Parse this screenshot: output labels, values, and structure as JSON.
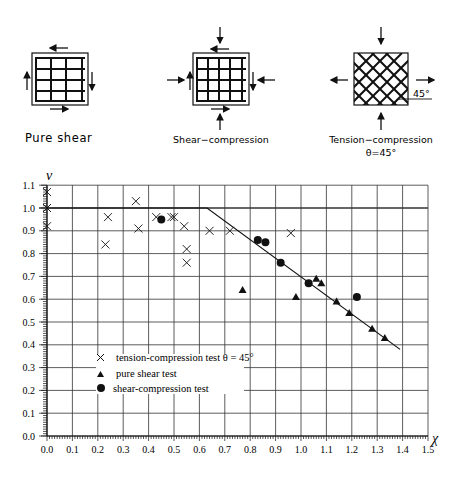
{
  "diagrams": [
    {
      "id": "pure-shear",
      "label": "Pure shear",
      "reinforcement": "orthogonal"
    },
    {
      "id": "shear-compression",
      "label": "Shear−compression",
      "reinforcement": "orthogonal"
    },
    {
      "id": "tension-compression",
      "label": "Tension−compression",
      "sublabel": "θ=45°",
      "angle_label": "45°",
      "reinforcement": "diagonal"
    }
  ],
  "chart_data": {
    "type": "scatter",
    "title": "",
    "xlabel": "χ",
    "ylabel": "ν",
    "xlim": [
      0.0,
      1.5
    ],
    "ylim": [
      0.0,
      1.1
    ],
    "grid": true,
    "xticks": [
      "0.0",
      "0.1",
      "0.2",
      "0.3",
      "0.4",
      "0.5",
      "0.6",
      "0.7",
      "0.8",
      "0.9",
      "1.0",
      "1.1",
      "1.2",
      "1.3",
      "1.4",
      "1.5"
    ],
    "yticks": [
      "0.0",
      "0.1",
      "0.2",
      "0.3",
      "0.4",
      "0.5",
      "0.6",
      "0.7",
      "0.8",
      "0.9",
      "1.0",
      "1.1"
    ],
    "legend_position": "lower-left inside",
    "series": [
      {
        "name": "tension-compression test θ = 45°",
        "marker": "x",
        "points": [
          [
            0.0,
            1.07
          ],
          [
            0.0,
            1.0
          ],
          [
            0.0,
            0.92
          ],
          [
            0.24,
            0.96
          ],
          [
            0.23,
            0.84
          ],
          [
            0.35,
            1.03
          ],
          [
            0.36,
            0.91
          ],
          [
            0.43,
            0.96
          ],
          [
            0.49,
            0.96
          ],
          [
            0.5,
            0.96
          ],
          [
            0.54,
            0.92
          ],
          [
            0.55,
            0.82
          ],
          [
            0.55,
            0.76
          ],
          [
            0.64,
            0.9
          ],
          [
            0.72,
            0.9
          ],
          [
            0.96,
            0.89
          ]
        ]
      },
      {
        "name": "pure shear test",
        "marker": "triangle",
        "points": [
          [
            0.77,
            0.64
          ],
          [
            0.98,
            0.61
          ],
          [
            1.06,
            0.69
          ],
          [
            1.08,
            0.67
          ],
          [
            1.14,
            0.59
          ],
          [
            1.19,
            0.54
          ],
          [
            1.28,
            0.47
          ],
          [
            1.33,
            0.43
          ]
        ]
      },
      {
        "name": "shear-compression test",
        "marker": "circle",
        "points": [
          [
            0.45,
            0.95
          ],
          [
            0.83,
            0.86
          ],
          [
            0.86,
            0.85
          ],
          [
            0.92,
            0.76
          ],
          [
            1.03,
            0.67
          ],
          [
            1.22,
            0.61
          ]
        ]
      }
    ],
    "curve": {
      "name": "theoretical limit",
      "points": [
        [
          0.0,
          1.0
        ],
        [
          0.63,
          1.0
        ],
        [
          1.39,
          0.38
        ]
      ]
    }
  }
}
